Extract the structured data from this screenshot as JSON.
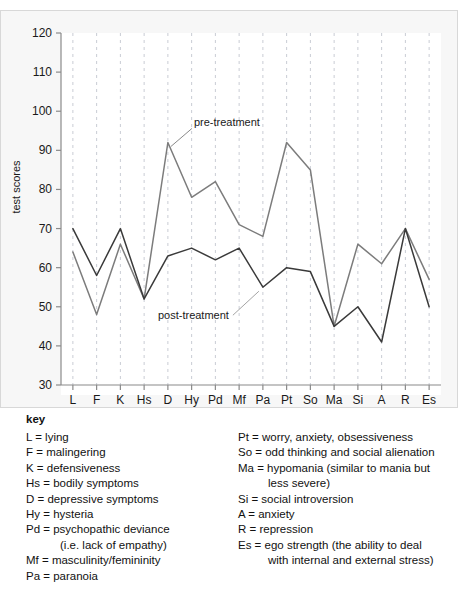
{
  "figure": {
    "clipped_heading": "",
    "axis": {
      "ylabel": "test scores",
      "yticks": [
        30,
        40,
        50,
        60,
        70,
        80,
        90,
        100,
        110,
        120
      ],
      "ymin": 30,
      "ymax": 120
    },
    "annotations": {
      "pre": "pre-treatment",
      "post": "post-treatment"
    },
    "colors": {
      "pre_line": "#7c7c7c",
      "post_line": "#3a3a3a",
      "gridline": "#c9ccd4",
      "axis": "#8a8a8a",
      "panel_bg": "#f7f7f7",
      "plot_bg": "#ffffff"
    }
  },
  "chart_data": {
    "type": "line",
    "title": "",
    "xlabel": "",
    "ylabel": "test scores",
    "ylim": [
      30,
      120
    ],
    "grid": true,
    "legend_position": "inline-annotation",
    "categories": [
      "L",
      "F",
      "K",
      "Hs",
      "D",
      "Hy",
      "Pd",
      "Mf",
      "Pa",
      "Pt",
      "So",
      "Ma",
      "Si",
      "A",
      "R",
      "Es"
    ],
    "series": [
      {
        "name": "pre-treatment",
        "color": "#7c7c7c",
        "values": [
          64,
          48,
          66,
          52,
          92,
          78,
          82,
          71,
          68,
          92,
          85,
          45,
          66,
          61,
          70,
          57
        ]
      },
      {
        "name": "post-treatment",
        "color": "#3a3a3a",
        "values": [
          70,
          58,
          70,
          52,
          63,
          65,
          62,
          65,
          55,
          60,
          59,
          45,
          50,
          41,
          70,
          50
        ]
      }
    ]
  },
  "key": {
    "title": "key",
    "left": [
      {
        "text": "L = lying"
      },
      {
        "text": "F = malingering"
      },
      {
        "text": "K = defensiveness"
      },
      {
        "text": "Hs = bodily symptoms"
      },
      {
        "text": "D = depressive symptoms"
      },
      {
        "text": "Hy = hysteria"
      },
      {
        "text": "Pd = psychopathic deviance",
        "cont": "(i.e. lack of empathy)"
      },
      {
        "text": "Mf = masculinity/femininity"
      },
      {
        "text": "Pa = paranoia"
      }
    ],
    "right": [
      {
        "text": "Pt = worry, anxiety, obsessiveness"
      },
      {
        "text": "So = odd thinking and social alienation"
      },
      {
        "text": "Ma = hypomania (similar to mania but",
        "cont": "less severe)"
      },
      {
        "text": "Si = social introversion"
      },
      {
        "text": "A = anxiety"
      },
      {
        "text": "R = repression"
      },
      {
        "text": "Es = ego strength (the ability to deal",
        "cont": "with internal and external stress)"
      }
    ]
  }
}
